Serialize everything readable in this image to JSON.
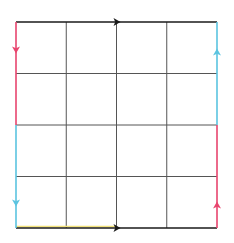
{
  "diagram": {
    "type": "square-grid-identification",
    "rows": 4,
    "cols": 4,
    "bounds": {
      "left": 16,
      "top": 22,
      "right": 217,
      "bottom": 228
    },
    "grid_line_color": "#555555",
    "edges": {
      "top": {
        "color": "#1a1a1a",
        "direction": "right",
        "arrow_at": 117
      },
      "bottom": {
        "color": "#1a1a1a",
        "direction": "right",
        "arrow_at": 117,
        "highlight_color": "#f2e27a"
      },
      "left_upper": {
        "color": "#e8456e",
        "direction": "down",
        "arrow_at": 50
      },
      "left_lower": {
        "color": "#5bc4e0",
        "direction": "down",
        "arrow_at": 203
      },
      "right_upper": {
        "color": "#5bc4e0",
        "direction": "up",
        "arrow_at": 52
      },
      "right_lower": {
        "color": "#e8456e",
        "direction": "up",
        "arrow_at": 205
      }
    }
  }
}
